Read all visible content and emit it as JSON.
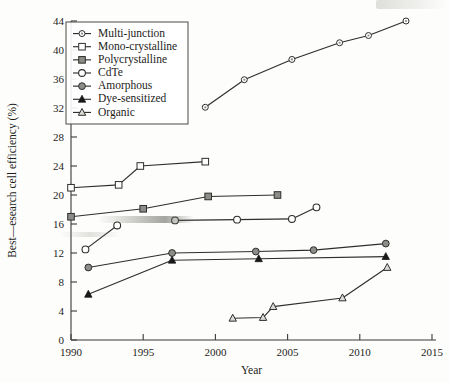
{
  "chart_data": {
    "type": "line",
    "title": "",
    "xlabel": "Year",
    "ylabel": "Best—esearch cell efficiency (%)",
    "xlim": [
      1990,
      2015
    ],
    "ylim": [
      0,
      44
    ],
    "xticks": [
      1990,
      1995,
      2000,
      2005,
      2010,
      2015
    ],
    "xtick_labels": [
      "1990",
      "1995",
      "2000",
      "2005",
      "2010",
      "2015"
    ],
    "yticks": [
      0,
      4,
      8,
      12,
      16,
      20,
      24,
      28,
      32,
      36,
      40,
      44
    ],
    "ytick_labels": [
      "0",
      "4",
      "8",
      "12",
      "16",
      "20",
      "24",
      "28",
      "32",
      "36",
      "40",
      "44"
    ],
    "grid": false,
    "legend_position": "upper-left",
    "series": [
      {
        "name": "Multi-junction",
        "marker": "circle-dot",
        "x": [
          1999.3,
          2002.0,
          2005.3,
          2008.6,
          2010.6,
          2013.2
        ],
        "y": [
          32.1,
          35.9,
          38.7,
          41.0,
          42.0,
          44.0
        ]
      },
      {
        "name": "Mono-crystalline",
        "marker": "square-open",
        "x": [
          1990.0,
          1993.3,
          1994.8,
          1999.3
        ],
        "y": [
          21.0,
          21.4,
          24.0,
          24.6
        ]
      },
      {
        "name": "Polycrystalline",
        "marker": "square-filled",
        "x": [
          1990.0,
          1995.0,
          1999.5,
          2004.3
        ],
        "y": [
          17.0,
          18.1,
          19.8,
          20.0
        ]
      },
      {
        "name": "CdTe",
        "marker": "circle-open",
        "x": [
          1997.2,
          2001.5,
          2005.3,
          2007.0
        ],
        "y": [
          16.5,
          16.6,
          16.7,
          18.3
        ]
      },
      {
        "name": "Amorphous",
        "marker": "circle-gray",
        "x": [
          1991.2,
          1997.0,
          2002.8,
          2006.8,
          2011.8
        ],
        "y": [
          10.0,
          12.0,
          12.2,
          12.4,
          13.3
        ]
      },
      {
        "name": "Dye-sensitized",
        "marker": "triangle-filled",
        "x": [
          1991.2,
          1997.0,
          2003.0,
          2011.8
        ],
        "y": [
          6.3,
          11.0,
          11.2,
          11.5
        ]
      },
      {
        "name": "Organic",
        "marker": "triangle-open",
        "x": [
          2001.2,
          2003.3,
          2004.0,
          2008.8,
          2011.9
        ],
        "y": [
          3.0,
          3.1,
          4.6,
          5.8,
          10.0
        ]
      },
      {
        "name": "CdTe-early",
        "marker": "circle-open",
        "x": [
          1991.0,
          1993.2
        ],
        "y": [
          12.5,
          15.8
        ]
      }
    ],
    "legend_entries": [
      {
        "label": "Multi-junction",
        "marker": "circle-dot"
      },
      {
        "label": "Mono-crystalline",
        "marker": "square-open"
      },
      {
        "label": "Polycrystalline",
        "marker": "square-filled"
      },
      {
        "label": "CdTe",
        "marker": "circle-open"
      },
      {
        "label": "Amorphous",
        "marker": "circle-gray"
      },
      {
        "label": "Dye-sensitized",
        "marker": "triangle-filled"
      },
      {
        "label": "Organic",
        "marker": "triangle-open"
      }
    ],
    "colors": {
      "line": "#2e2e2c",
      "axis": "#3a3a38",
      "text": "#1d1d1b",
      "marker_gray": "#8c8c88",
      "marker_fill_light": "#b8b8b4",
      "background": "#fdfdfb"
    }
  }
}
